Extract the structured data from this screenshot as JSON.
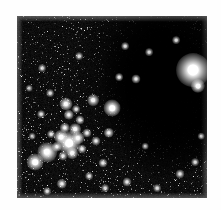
{
  "document": {
    "type": "astronomical-image",
    "title": "Star field with dark nebula",
    "background_color": "#fefefe",
    "plate_color": "#000000"
  },
  "figure": {
    "name": "sky-figure",
    "x": 17,
    "y": 16,
    "width": 190,
    "height": 182,
    "caption": ""
  },
  "sky_features": {
    "dark_nebula": {
      "label": "dark-nebula",
      "center_x": 152,
      "center_y": 71,
      "width": 128,
      "height": 178,
      "description": "opaque dust cloud / void with few stars"
    },
    "star_cluster": {
      "label": "open-cluster",
      "center_x": 57,
      "center_y": 122,
      "radius": 30,
      "description": "compact concentration of resolved stars at lower left"
    },
    "brightest_star": {
      "label": "bright-foreground-star",
      "x": 176,
      "y": 54,
      "size": 13,
      "brightness": 1.0
    }
  },
  "chart_data": {
    "type": "scatter",
    "xlabel": "",
    "ylabel": "",
    "xlim": [
      0,
      190
    ],
    "ylim": [
      0,
      182
    ],
    "grid": false,
    "legend": null,
    "series": [
      {
        "name": "stars",
        "note": "x, y in figure pixel coordinates; s = apparent diameter px; b = relative brightness 0-1",
        "points": [
          {
            "x": 176,
            "y": 54,
            "s": 13.0,
            "b": 1.0
          },
          {
            "x": 181,
            "y": 70,
            "s": 5.5,
            "b": 0.8
          },
          {
            "x": 52,
            "y": 127,
            "s": 9.0,
            "b": 0.98
          },
          {
            "x": 44,
            "y": 121,
            "s": 5.5,
            "b": 0.85
          },
          {
            "x": 61,
            "y": 122,
            "s": 5.0,
            "b": 0.82
          },
          {
            "x": 58,
            "y": 113,
            "s": 4.5,
            "b": 0.78
          },
          {
            "x": 48,
            "y": 112,
            "s": 4.0,
            "b": 0.72
          },
          {
            "x": 40,
            "y": 131,
            "s": 4.0,
            "b": 0.7
          },
          {
            "x": 55,
            "y": 137,
            "s": 4.5,
            "b": 0.74
          },
          {
            "x": 65,
            "y": 133,
            "s": 3.5,
            "b": 0.66
          },
          {
            "x": 70,
            "y": 117,
            "s": 3.5,
            "b": 0.64
          },
          {
            "x": 46,
            "y": 140,
            "s": 3.5,
            "b": 0.62
          },
          {
            "x": 34,
            "y": 118,
            "s": 3.0,
            "b": 0.58
          },
          {
            "x": 63,
            "y": 104,
            "s": 3.5,
            "b": 0.62
          },
          {
            "x": 52,
            "y": 99,
            "s": 4.0,
            "b": 0.7
          },
          {
            "x": 49,
            "y": 88,
            "s": 5.0,
            "b": 0.86
          },
          {
            "x": 59,
            "y": 93,
            "s": 3.0,
            "b": 0.55
          },
          {
            "x": 30,
            "y": 136,
            "s": 7.5,
            "b": 0.92
          },
          {
            "x": 24,
            "y": 98,
            "s": 3.0,
            "b": 0.54
          },
          {
            "x": 33,
            "y": 77,
            "s": 3.0,
            "b": 0.52
          },
          {
            "x": 18,
            "y": 146,
            "s": 6.5,
            "b": 0.9
          },
          {
            "x": 79,
            "y": 125,
            "s": 3.5,
            "b": 0.62
          },
          {
            "x": 95,
            "y": 92,
            "s": 6.5,
            "b": 0.93
          },
          {
            "x": 76,
            "y": 84,
            "s": 4.5,
            "b": 0.75
          },
          {
            "x": 92,
            "y": 117,
            "s": 4.0,
            "b": 0.7
          },
          {
            "x": 102,
            "y": 61,
            "s": 3.0,
            "b": 0.55
          },
          {
            "x": 119,
            "y": 63,
            "s": 3.5,
            "b": 0.58
          },
          {
            "x": 86,
            "y": 147,
            "s": 3.5,
            "b": 0.6
          },
          {
            "x": 72,
            "y": 160,
            "s": 3.0,
            "b": 0.55
          },
          {
            "x": 45,
            "y": 168,
            "s": 4.0,
            "b": 0.66
          },
          {
            "x": 30,
            "y": 175,
            "s": 3.0,
            "b": 0.52
          },
          {
            "x": 110,
            "y": 166,
            "s": 3.5,
            "b": 0.58
          },
          {
            "x": 140,
            "y": 172,
            "s": 3.0,
            "b": 0.5
          },
          {
            "x": 163,
            "y": 158,
            "s": 3.5,
            "b": 0.56
          },
          {
            "x": 178,
            "y": 146,
            "s": 3.0,
            "b": 0.5
          },
          {
            "x": 184,
            "y": 120,
            "s": 2.5,
            "b": 0.45
          },
          {
            "x": 159,
            "y": 24,
            "s": 3.0,
            "b": 0.5
          },
          {
            "x": 132,
            "y": 36,
            "s": 3.0,
            "b": 0.48
          },
          {
            "x": 108,
            "y": 30,
            "s": 3.0,
            "b": 0.5
          },
          {
            "x": 62,
            "y": 40,
            "s": 3.0,
            "b": 0.48
          },
          {
            "x": 25,
            "y": 52,
            "s": 3.0,
            "b": 0.48
          },
          {
            "x": 88,
            "y": 172,
            "s": 3.0,
            "b": 0.5
          },
          {
            "x": 15,
            "y": 120,
            "s": 2.5,
            "b": 0.44
          },
          {
            "x": 12,
            "y": 72,
            "s": 2.5,
            "b": 0.44
          },
          {
            "x": 128,
            "y": 130,
            "s": 2.5,
            "b": 0.42
          }
        ]
      }
    ]
  }
}
